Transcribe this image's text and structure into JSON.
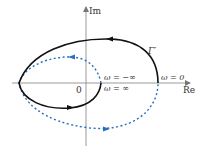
{
  "diagram": {
    "type": "nyquist-plot",
    "axes": {
      "imag_label": "Im",
      "real_label": "Re",
      "origin_label": "0"
    },
    "curve_label": "Γ′",
    "annotations": {
      "omega_zero": "ω = 0",
      "omega_neg_inf": "ω = −∞",
      "omega_pos_inf": "ω = ∞"
    },
    "colors": {
      "axis": "#888888",
      "solid_curve": "#111111",
      "dashed_curve": "#2a6fbf",
      "text": "#333333"
    }
  }
}
